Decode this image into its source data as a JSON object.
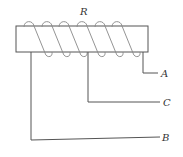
{
  "diagram": {
    "type": "variable-resistor-rheostat",
    "labels": {
      "resistor": "R",
      "terminal_a": "A",
      "terminal_b": "B",
      "terminal_c": "C"
    },
    "coil_turns": 6,
    "colors": {
      "wire": "#555555",
      "coil": "#888888",
      "label": "#333333"
    }
  }
}
